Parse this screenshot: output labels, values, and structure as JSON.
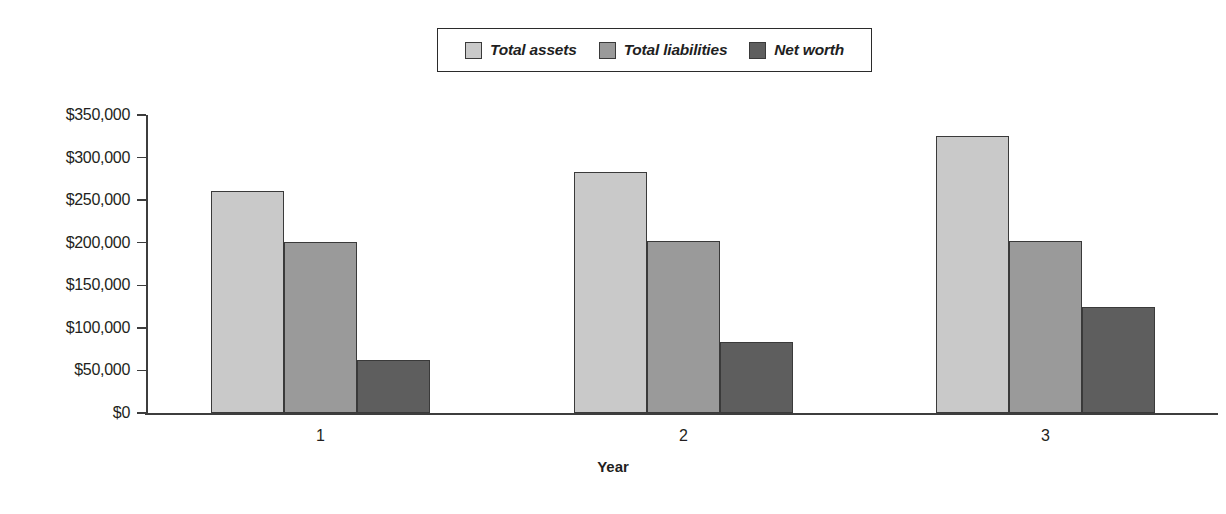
{
  "chart_data": {
    "type": "bar",
    "title": "",
    "subtitle": "",
    "xlabel": "Year",
    "ylabel": "",
    "categories": [
      "1",
      "2",
      "3"
    ],
    "series": [
      {
        "name": "Total assets",
        "color": "#c9c9c9",
        "values": [
          261000,
          283000,
          325000
        ]
      },
      {
        "name": "Total liabilities",
        "color": "#9a9a9a",
        "values": [
          201000,
          202000,
          202000
        ]
      },
      {
        "name": "Net worth",
        "color": "#5e5e5e",
        "values": [
          62000,
          83000,
          124000
        ]
      }
    ],
    "ylim": [
      0,
      350000
    ],
    "ytick_values": [
      0,
      50000,
      100000,
      150000,
      200000,
      250000,
      300000,
      350000
    ],
    "ytick_labels": [
      "$0",
      "$50,000",
      "$100,000",
      "$150,000",
      "$200,000",
      "$250,000",
      "$300,000",
      "$350,000"
    ],
    "grid": false,
    "legend_position": "top-center",
    "legend_border_color": "#2b2b2b",
    "axis_color": "#3d3d3d",
    "background": "#ffffff"
  }
}
